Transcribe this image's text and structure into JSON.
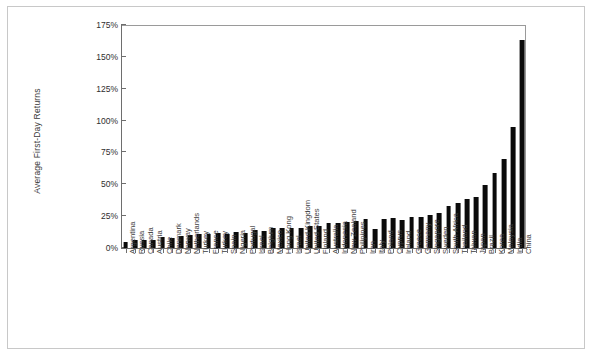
{
  "chart_data": {
    "type": "bar",
    "title": "",
    "subtitle": "",
    "xlabel": "",
    "ylabel": "Average First-Day Returns",
    "ylim": [
      0,
      175
    ],
    "y_tick_labels": [
      "175%",
      "150%",
      "125%",
      "100%",
      "75%",
      "50%",
      "25%",
      "0%"
    ],
    "y_tick_values": [
      175,
      150,
      125,
      100,
      75,
      50,
      25,
      0
    ],
    "grid": false,
    "legend": null,
    "orientation": "vertical",
    "bar_color": "#0b0b0b",
    "categories": [
      "Argentina",
      "Russia",
      "Canada",
      "Austria",
      "Chile",
      "Denmark",
      "Norway",
      "Netherlands",
      "Turkey",
      "France",
      "Turkey",
      "Spain",
      "Nigeria",
      "Portugal",
      "Israel",
      "Belgium",
      "Mexico",
      "Hong Kong",
      "Israel",
      "United Kingdom",
      "United States",
      "Finland",
      "Australia",
      "Indonesia",
      "New Zealand",
      "Philipines",
      "Iran",
      "Italy",
      "Poland",
      "Cyprus",
      "Ireland",
      "Greece",
      "Germany",
      "Singapore",
      "Sweden",
      "South Africa",
      "Thailand",
      "Taiwan",
      "Japan",
      "Brazil",
      "Korea",
      "Malaysia",
      "India",
      "China"
    ],
    "values": [
      4.4,
      6.5,
      6.5,
      6.5,
      8.8,
      8.0,
      9.6,
      10.2,
      10.7,
      10.7,
      11.4,
      10.8,
      12.7,
      11.9,
      13.8,
      13.5,
      15.9,
      15.4,
      15.9,
      16.0,
      16.9,
      17.2,
      19.8,
      20.0,
      20.3,
      21.2,
      22.4,
      15.2,
      22.9,
      23.7,
      21.6,
      24.2,
      24.2,
      25.8,
      27.3,
      32.7,
      35.1,
      38.1,
      40.2,
      49.4,
      58.8,
      69.6,
      94.7,
      163.0
    ],
    "value_unit": "%",
    "note": "Average IPO first-day returns by country, sorted ascending"
  }
}
